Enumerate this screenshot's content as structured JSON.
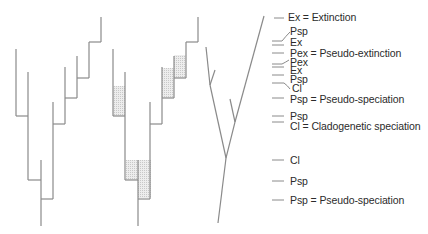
{
  "colors": {
    "line": "#8a8a8a",
    "hatch_fill": "#e2e2e2",
    "text": "#2b2b2b"
  },
  "labels": [
    {
      "text": "Ex = Extinction",
      "x": 288,
      "y": 12
    },
    {
      "text": "Psp",
      "x": 290,
      "y": 26
    },
    {
      "text": "Ex",
      "x": 290,
      "y": 37
    },
    {
      "text": "Pex = Pseudo-extinction",
      "x": 290,
      "y": 48
    },
    {
      "text": "Pex",
      "x": 290,
      "y": 58
    },
    {
      "text": "Ex",
      "x": 290,
      "y": 66
    },
    {
      "text": "Psp",
      "x": 290,
      "y": 75
    },
    {
      "text": "Cl",
      "x": 292,
      "y": 84
    },
    {
      "text": "Psp = Pseudo-speciation",
      "x": 290,
      "y": 94
    },
    {
      "text": "Psp",
      "x": 290,
      "y": 112
    },
    {
      "text": "Cl = Cladogenetic speciation",
      "x": 290,
      "y": 122
    },
    {
      "text": "Cl",
      "x": 290,
      "y": 156
    },
    {
      "text": "Psp",
      "x": 290,
      "y": 177
    },
    {
      "text": "Psp = Pseudo-speciation",
      "x": 290,
      "y": 196
    }
  ]
}
